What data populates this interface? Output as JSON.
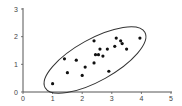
{
  "chart_data": {
    "type": "scatter",
    "title": "",
    "xlabel": "",
    "ylabel": "",
    "xlim": [
      0,
      5
    ],
    "ylim": [
      0,
      3
    ],
    "x_ticks": [
      "0",
      "1",
      "2",
      "3",
      "4",
      "5"
    ],
    "y_ticks": [
      "0",
      "1",
      "2",
      "3"
    ],
    "grid": false,
    "legend": null,
    "annotations": [
      "ellipse enclosing the data points"
    ],
    "points": [
      {
        "x": 1.0,
        "y": 0.3
      },
      {
        "x": 1.4,
        "y": 1.2
      },
      {
        "x": 1.5,
        "y": 0.7
      },
      {
        "x": 1.8,
        "y": 1.15
      },
      {
        "x": 2.0,
        "y": 0.6
      },
      {
        "x": 2.1,
        "y": 0.9
      },
      {
        "x": 2.4,
        "y": 1.85
      },
      {
        "x": 2.4,
        "y": 1.05
      },
      {
        "x": 2.45,
        "y": 1.35
      },
      {
        "x": 2.55,
        "y": 1.35
      },
      {
        "x": 2.6,
        "y": 1.55
      },
      {
        "x": 2.7,
        "y": 1.3
      },
      {
        "x": 2.85,
        "y": 1.55
      },
      {
        "x": 2.9,
        "y": 0.75
      },
      {
        "x": 3.1,
        "y": 1.65
      },
      {
        "x": 3.15,
        "y": 1.95
      },
      {
        "x": 3.3,
        "y": 1.85
      },
      {
        "x": 3.35,
        "y": 1.75
      },
      {
        "x": 3.5,
        "y": 1.55
      },
      {
        "x": 3.95,
        "y": 1.95
      }
    ]
  }
}
